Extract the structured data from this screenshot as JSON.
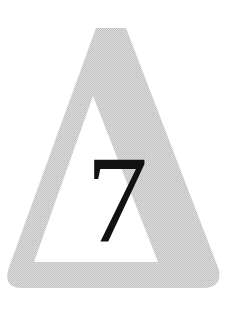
{
  "sign": {
    "shape": "triangle",
    "numeral": "7",
    "colors": {
      "background": "#ffffff",
      "frame": "#cfcfcf",
      "inner": "#ffffff",
      "numeral": "#111111"
    }
  }
}
